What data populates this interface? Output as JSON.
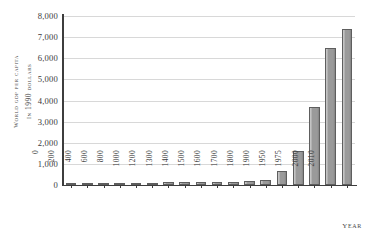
{
  "chart_data": {
    "type": "bar",
    "title": "",
    "xlabel": "Year",
    "ylabel": "World GDP per capita in 1990 dollars",
    "ylabel_lines": [
      "World GDP per capita",
      "in 1990 dollars"
    ],
    "categories": [
      "0",
      "200",
      "400",
      "600",
      "800",
      "1000",
      "1200",
      "1300",
      "1400",
      "1500",
      "1600",
      "1700",
      "1800",
      "1900",
      "1950",
      "1975",
      "2000",
      "2010"
    ],
    "values": [
      100,
      100,
      105,
      105,
      110,
      115,
      120,
      130,
      135,
      150,
      165,
      185,
      230,
      680,
      1600,
      3700,
      6500,
      7400
    ],
    "ylim": [
      0,
      8000
    ],
    "ytick_values": [
      0,
      1000,
      2000,
      3000,
      4000,
      5000,
      6000,
      7000,
      8000
    ],
    "ytick_labels": [
      "0",
      "1,000",
      "2,000",
      "3,000",
      "4,000",
      "5,000",
      "6,000",
      "7,000",
      "8,000"
    ],
    "grid": true,
    "legend": false,
    "bar_color": "#9a9a9a",
    "bar_edge_color": "#5e5e5e",
    "gridline_color": "#d8d8d8",
    "axis_color": "#3d3d3d",
    "background": "#ffffff"
  }
}
